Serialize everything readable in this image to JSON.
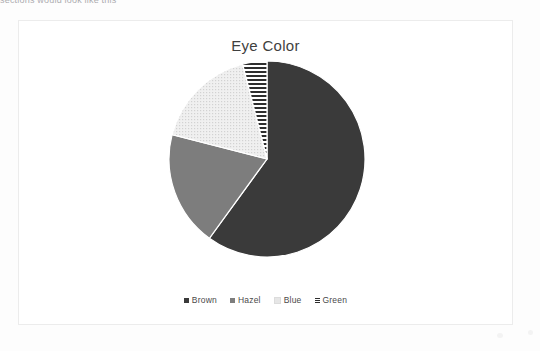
{
  "document": {
    "cropped_text_sliver": "sections would look like this"
  },
  "chart_panel": {
    "title": "Eye Color"
  },
  "legend": {
    "items": [
      {
        "label": "Brown",
        "swatch": "brown-swatch-icon",
        "color": "#3a3a3a",
        "fill": "solid"
      },
      {
        "label": "Hazel",
        "swatch": "hazel-swatch-icon",
        "color": "#7d7d7d",
        "fill": "solid"
      },
      {
        "label": "Blue",
        "swatch": "blue-swatch-icon",
        "color": "#e6e6e6",
        "fill": "dotted"
      },
      {
        "label": "Green",
        "swatch": "green-swatch-icon",
        "color": "#2e2e2e",
        "fill": "horizontal-stripes"
      }
    ]
  },
  "chart_data": {
    "type": "pie",
    "title": "Eye Color",
    "xlabel": "",
    "ylabel": "",
    "grid": false,
    "legend_position": "bottom",
    "start_angle_deg": 0,
    "direction": "clockwise",
    "categories": [
      "Brown",
      "Hazel",
      "Blue",
      "Green"
    ],
    "values": [
      60,
      19,
      17,
      4
    ],
    "units": "percent",
    "slices": [
      {
        "label": "Brown",
        "value": 60,
        "color": "#3a3a3a",
        "pattern": "solid",
        "start_deg": 0,
        "end_deg": 216
      },
      {
        "label": "Hazel",
        "value": 19,
        "color": "#7d7d7d",
        "pattern": "solid",
        "start_deg": 216,
        "end_deg": 284.4
      },
      {
        "label": "Blue",
        "value": 17,
        "color": "#e6e6e6",
        "pattern": "fine-dots",
        "start_deg": 284.4,
        "end_deg": 345.6
      },
      {
        "label": "Green",
        "value": 4,
        "color": "#2e2e2e",
        "pattern": "horizontal-stripes",
        "start_deg": 345.6,
        "end_deg": 360
      }
    ]
  }
}
